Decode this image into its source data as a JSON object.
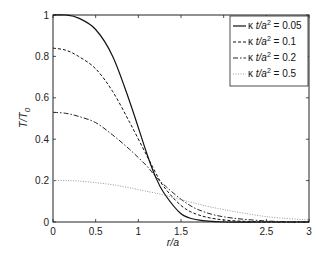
{
  "chart_data": {
    "type": "line",
    "title": "",
    "xlabel": "r/a",
    "ylabel": "T/T0",
    "xlim": [
      0,
      3
    ],
    "ylim": [
      0,
      1
    ],
    "xticks": [
      "0",
      "0.5",
      "1",
      "1.5",
      "",
      "2.5",
      "3"
    ],
    "yticks": [
      "0",
      "0.2",
      "0.4",
      "0.6",
      "0.8",
      "1"
    ],
    "grid": false,
    "legend_position": "upper right",
    "x": [
      0,
      0.15,
      0.3,
      0.5,
      0.7,
      0.9,
      1.1,
      1.2,
      1.3,
      1.5,
      1.7,
      2.0,
      2.5,
      3.0
    ],
    "series": [
      {
        "name": "κ t/a² = 0.05",
        "style": "solid",
        "values": [
          1.0,
          1.0,
          0.985,
          0.93,
          0.8,
          0.58,
          0.33,
          0.22,
          0.14,
          0.04,
          0.01,
          0.0,
          0.0,
          0.0
        ]
      },
      {
        "name": "κ t/a² = 0.1",
        "style": "dashed",
        "values": [
          0.84,
          0.83,
          0.8,
          0.74,
          0.63,
          0.48,
          0.32,
          0.24,
          0.17,
          0.08,
          0.035,
          0.01,
          0.0,
          0.0
        ]
      },
      {
        "name": "κ t/a² = 0.2",
        "style": "dashdot",
        "values": [
          0.53,
          0.525,
          0.51,
          0.48,
          0.42,
          0.35,
          0.27,
          0.22,
          0.18,
          0.11,
          0.06,
          0.025,
          0.005,
          0.0
        ]
      },
      {
        "name": "κ t/a² = 0.5",
        "style": "dotted",
        "values": [
          0.2,
          0.2,
          0.198,
          0.19,
          0.18,
          0.165,
          0.148,
          0.14,
          0.13,
          0.108,
          0.087,
          0.06,
          0.026,
          0.01
        ]
      }
    ]
  },
  "axes": {
    "xlabel_r": "r",
    "xlabel_rest": "/a",
    "ylabel_T": "T/T",
    "ylabel_sub": "0"
  },
  "legend": [
    {
      "kappa": "κ",
      "text": " t/a",
      "sup": "2",
      "eq": " = 0.05"
    },
    {
      "kappa": "κ",
      "text": " t/a",
      "sup": "2",
      "eq": " = 0.1"
    },
    {
      "kappa": "κ",
      "text": " t/a",
      "sup": "2",
      "eq": " = 0.2"
    },
    {
      "kappa": "κ",
      "text": " t/a",
      "sup": "2",
      "eq": " = 0.5"
    }
  ]
}
